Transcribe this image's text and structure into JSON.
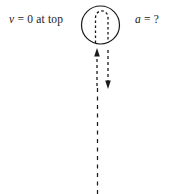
{
  "figure": {
    "type": "physics-diagram",
    "background_color": "#ffffff",
    "stroke_color": "#1a1a1a",
    "width": 174,
    "height": 194,
    "labels": {
      "left": {
        "symbol": "v",
        "text": " = 0 at top",
        "full": "v = 0 at top"
      },
      "right": {
        "symbol": "a",
        "text": " = ?",
        "full": "a = ?"
      }
    },
    "shapes": {
      "loop_circle": {
        "cx": 100.5,
        "cy": 25,
        "r": 19,
        "style": "solid"
      },
      "turnaround_path": {
        "style": "dashed",
        "shape": "inverted-u"
      },
      "up_arrow": {
        "x": 97,
        "y_top": 50,
        "y_bottom": 86,
        "direction": "up",
        "style": "dashed"
      },
      "down_arrow": {
        "x": 108,
        "y_top": 50,
        "y_bottom": 89,
        "direction": "down",
        "style": "dashed"
      },
      "lower_trajectory": {
        "x": 97,
        "y_top": 88,
        "y_bottom": 194,
        "style": "dashed"
      }
    }
  }
}
